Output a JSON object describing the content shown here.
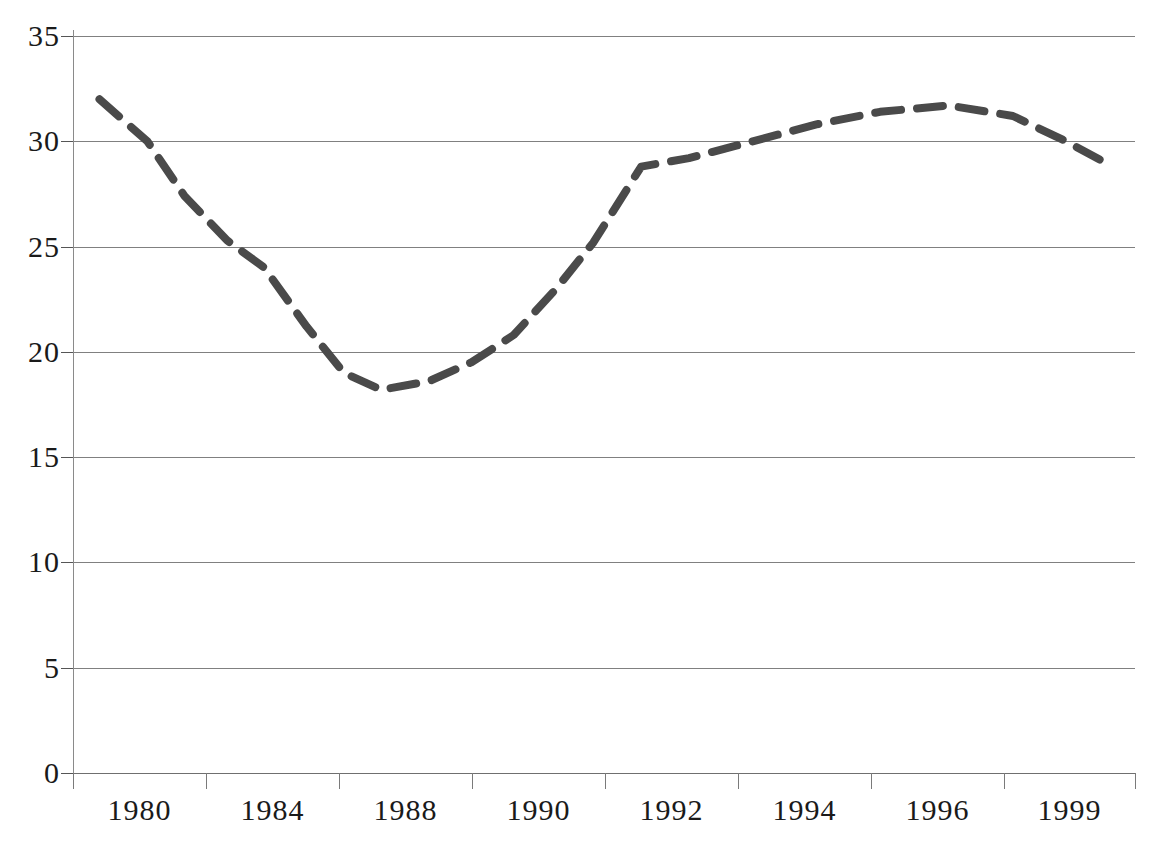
{
  "chart_data": {
    "type": "line",
    "title": "",
    "subtitle": "",
    "xlabel": "",
    "ylabel": "",
    "xlim": [
      1979.5,
      1999.5
    ],
    "ylim": [
      0,
      35
    ],
    "grid": true,
    "legend": "none",
    "y_ticks": [
      35,
      30,
      25,
      20,
      15,
      10,
      5,
      0
    ],
    "y_tick_labels": [
      "35",
      "30",
      "25",
      "20",
      "15",
      "10",
      "5",
      "0"
    ],
    "x_tick_labels": [
      "1980",
      "1984",
      "1988",
      "1990",
      "1992",
      "1994",
      "1996",
      "1999"
    ],
    "series": [
      {
        "name": "series-1",
        "style": "dashed",
        "color": "#4a4a4a",
        "line_width": 8,
        "categories": [
          "1980",
          "1981",
          "1982",
          "1983",
          "1984",
          "1985",
          "1986",
          "1987",
          "1988",
          "1989",
          "1990",
          "1991",
          "1992",
          "1993",
          "1994",
          "1995",
          "1996",
          "1997",
          "1998",
          "1999"
        ],
        "values": [
          32.0,
          30.0,
          27.4,
          25.3,
          24.0,
          21.2,
          19.0,
          18.2,
          18.6,
          19.5,
          20.8,
          23.0,
          25.2,
          28.8,
          29.2,
          30.0,
          30.8,
          31.4,
          31.7,
          28.9
        ],
        "points": [
          {
            "x": 1980.0,
            "y": 32.0
          },
          {
            "x": 1980.9,
            "y": 30.0
          },
          {
            "x": 1981.6,
            "y": 27.4
          },
          {
            "x": 1982.4,
            "y": 25.3
          },
          {
            "x": 1983.1,
            "y": 24.0
          },
          {
            "x": 1983.9,
            "y": 21.2
          },
          {
            "x": 1984.6,
            "y": 19.0
          },
          {
            "x": 1985.3,
            "y": 18.2
          },
          {
            "x": 1986.2,
            "y": 18.6
          },
          {
            "x": 1987.0,
            "y": 19.5
          },
          {
            "x": 1987.8,
            "y": 20.8
          },
          {
            "x": 1988.6,
            "y": 23.0
          },
          {
            "x": 1989.3,
            "y": 25.2
          },
          {
            "x": 1990.2,
            "y": 28.8
          },
          {
            "x": 1991.1,
            "y": 29.2
          },
          {
            "x": 1992.3,
            "y": 30.0
          },
          {
            "x": 1993.5,
            "y": 30.8
          },
          {
            "x": 1994.7,
            "y": 31.4
          },
          {
            "x": 1996.0,
            "y": 31.7
          },
          {
            "x": 1997.2,
            "y": 31.2
          },
          {
            "x": 1998.2,
            "y": 30.0
          },
          {
            "x": 1999.0,
            "y": 28.9
          }
        ]
      }
    ],
    "colors": {
      "series_line": "#4a4a4a",
      "gridline": "#808080",
      "axis": "#6f6f6f",
      "text": "#1a1a1a",
      "background": "#ffffff"
    }
  },
  "plot": {
    "left": 73,
    "top": 36,
    "width": 1062,
    "height": 737,
    "x_tick_positions": [
      73,
      206,
      339,
      472,
      605,
      738,
      871,
      1004,
      1135
    ]
  }
}
